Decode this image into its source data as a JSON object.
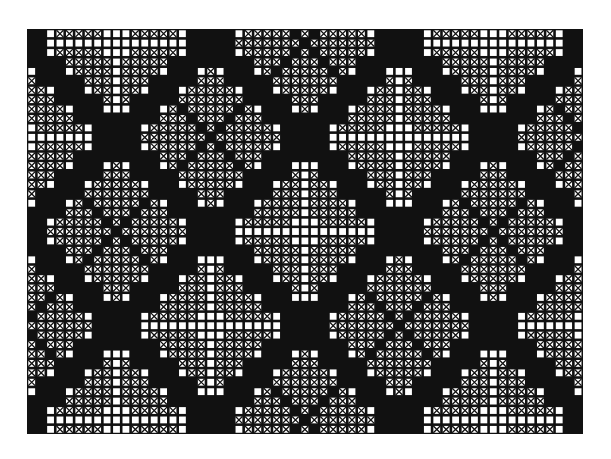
{
  "chart": {
    "grid": {
      "cols": 59,
      "rows": 43,
      "origin_x": 27,
      "origin_y": 29,
      "cell": 9.42
    },
    "colors": {
      "background": "#ffffff",
      "ink": "#111111",
      "cell_open": "#ffffff"
    },
    "legend": {
      "open": "empty square",
      "cross": "X-stitch square",
      "solid": "filled square"
    },
    "lattice": {
      "center_col": 29,
      "center_row": 21,
      "period": 20,
      "band_half_width": 1,
      "dot_offset": 2
    },
    "motifs": {
      "hearts": {
        "lobe_offset": 4,
        "lobe_radius": 4.2,
        "axis_gap": 0
      },
      "cross_diamond": {
        "fill_radius": 7,
        "cross_width": 0
      }
    }
  }
}
